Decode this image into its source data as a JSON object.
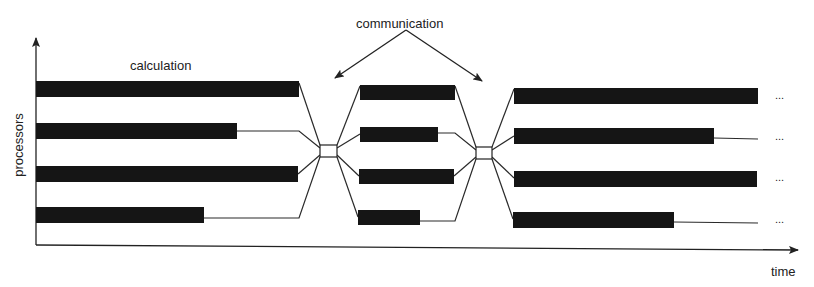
{
  "labels": {
    "calculation": "calculation",
    "communication": "communication",
    "y_axis": "processors",
    "x_axis": "time",
    "continuation": "..."
  },
  "colors": {
    "bar": "#151515",
    "line": "#2a2a2a",
    "background": "#ffffff"
  },
  "phases": [
    {
      "name": "calculation-phase-1",
      "bars": [
        {
          "x1": 36,
          "x2": 299,
          "y": 90
        },
        {
          "x1": 36,
          "x2": 237,
          "y": 131
        },
        {
          "x1": 36,
          "x2": 298,
          "y": 174
        },
        {
          "x1": 36,
          "x2": 204,
          "y": 214
        }
      ]
    },
    {
      "name": "calculation-phase-2",
      "bars": [
        {
          "x1": 360,
          "x2": 455,
          "y": 92
        },
        {
          "x1": 360,
          "x2": 438,
          "y": 134
        },
        {
          "x1": 359,
          "x2": 454,
          "y": 176
        },
        {
          "x1": 358,
          "x2": 420,
          "y": 217
        }
      ]
    },
    {
      "name": "calculation-phase-3",
      "bars": [
        {
          "x1": 514,
          "x2": 758,
          "y": 96
        },
        {
          "x1": 514,
          "x2": 714,
          "y": 136
        },
        {
          "x1": 514,
          "x2": 757,
          "y": 179
        },
        {
          "x1": 513,
          "x2": 674,
          "y": 219
        }
      ]
    }
  ],
  "sync_nodes": [
    {
      "name": "communication-node-1",
      "x": 320,
      "y": 145,
      "w": 17,
      "h": 12
    },
    {
      "name": "communication-node-2",
      "x": 476,
      "y": 147,
      "w": 16,
      "h": 12
    }
  ]
}
